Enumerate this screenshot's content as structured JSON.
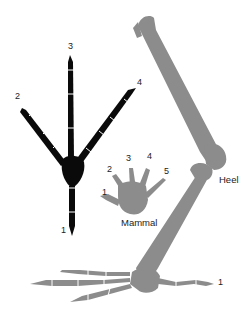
{
  "diagram": {
    "colors": {
      "bird_foot_top_view": "#0a0a0a",
      "leg_and_mammal": "#8c8c8c",
      "background": "#ffffff",
      "label": "#222222"
    },
    "bird_foot_top_view": {
      "toe_labels": [
        "3",
        "2",
        "4",
        "1"
      ]
    },
    "mammal_hand": {
      "title": "Mammal",
      "digit_labels": [
        "1",
        "2",
        "3",
        "4",
        "5"
      ]
    },
    "bird_leg_side_view": {
      "heel_label": "Heel",
      "hind_toe_label": "1"
    }
  }
}
